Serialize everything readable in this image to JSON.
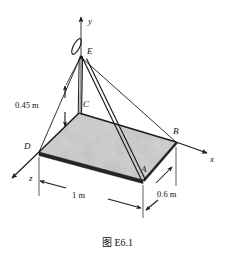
{
  "figure": {
    "caption": "图 E6.1",
    "caption_prefix": "图",
    "caption_number": "E6.1",
    "type": "engineering-mechanics-3d-diagram",
    "background_color": "#ffffff",
    "line_color": "#1a1a1a",
    "plate_fill": "#cfcfcf"
  },
  "axes": [
    {
      "id": "y",
      "label": "y",
      "direction": "up",
      "label_x": 88,
      "label_y": 17
    },
    {
      "id": "x",
      "label": "x",
      "direction": "right-down",
      "label_x": 210,
      "label_y": 155
    },
    {
      "id": "z",
      "label": "z",
      "direction": "left-down",
      "label_x": 29,
      "label_y": 174
    }
  ],
  "points": [
    {
      "id": "A",
      "label": "A",
      "label_x": 141,
      "label_y": 171,
      "x": 143,
      "y": 180
    },
    {
      "id": "B",
      "label": "B",
      "label_x": 173,
      "label_y": 131,
      "x": 176,
      "y": 142
    },
    {
      "id": "C",
      "label": "C",
      "label_x": 82,
      "label_y": 104,
      "x": 79,
      "y": 113
    },
    {
      "id": "D",
      "label": "D",
      "label_x": 25,
      "label_y": 147,
      "x": 39,
      "y": 152
    },
    {
      "id": "E",
      "label": "E",
      "label_x": 87,
      "label_y": 50,
      "x": 81,
      "y": 57
    }
  ],
  "dimensions": [
    {
      "id": "height-CE",
      "label": "0.45 m",
      "value": 0.45,
      "unit": "m",
      "label_x": 16,
      "label_y": 104,
      "orientation": "vertical"
    },
    {
      "id": "length-DA",
      "label": "1 m",
      "value": 1,
      "unit": "m",
      "label_x": 72,
      "label_y": 191,
      "orientation": "horizontal"
    },
    {
      "id": "width-AB",
      "label": "0.6 m",
      "value": 0.6,
      "unit": "m",
      "label_x": 159,
      "label_y": 192,
      "orientation": "diagonal"
    }
  ],
  "members": [
    {
      "id": "post-EC",
      "from": "E",
      "to": "C",
      "kind": "vertical-post"
    },
    {
      "id": "cable-EA",
      "from": "E",
      "to": "A",
      "kind": "cable-pair"
    },
    {
      "id": "cable-EB",
      "from": "E",
      "to": "B",
      "kind": "cable"
    },
    {
      "id": "cable-ED",
      "from": "E",
      "to": "D",
      "kind": "cable"
    },
    {
      "id": "hook-E",
      "from": "E",
      "to": "E",
      "kind": "hook"
    }
  ]
}
